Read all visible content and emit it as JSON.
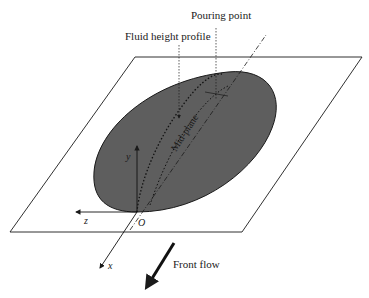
{
  "figure": {
    "labels": {
      "pouring_point": "Pouring point",
      "fluid_height_profile": "Fluid height profile",
      "mid_plane": "Mid-plane",
      "front_flow": "Front flow"
    },
    "axes": {
      "origin": "O",
      "x": "x",
      "y": "y",
      "z": "z"
    },
    "colors": {
      "fluid_fill": "#5e5e5e",
      "line": "#1a1a1a",
      "background": "#ffffff"
    }
  }
}
